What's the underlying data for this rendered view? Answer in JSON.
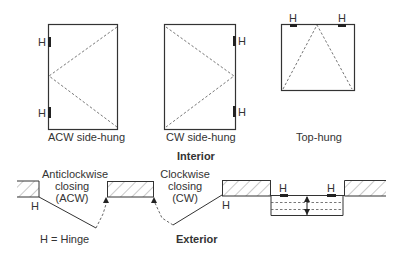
{
  "diagram": {
    "interior_label": "Interior",
    "exterior_label": "Exterior",
    "legend": "H = Hinge",
    "hinge_marker": "H",
    "windows": [
      {
        "id": "acw",
        "label": "ACW side-hung",
        "hinge_side": "left"
      },
      {
        "id": "cw",
        "label": "CW side-hung",
        "hinge_side": "right"
      },
      {
        "id": "top",
        "label": "Top-hung",
        "hinge_side": "top"
      }
    ],
    "plan_labels": {
      "acw": [
        "Anticlockwise",
        "closing",
        "(ACW)"
      ],
      "cw": [
        "Clockwise",
        "closing",
        "(CW)"
      ]
    },
    "colors": {
      "line": "#333333",
      "hatch": "#555555",
      "dash": "#666666",
      "background": "#ffffff"
    }
  }
}
